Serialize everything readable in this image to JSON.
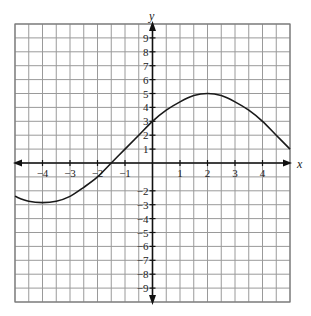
{
  "chart_data": {
    "type": "line",
    "title": "",
    "xlabel": "x",
    "ylabel": "y",
    "xlim": [
      -5,
      5
    ],
    "ylim": [
      -10,
      10
    ],
    "grid": true,
    "grid_x_step": 0.5,
    "grid_y_step": 1,
    "x_ticks": [
      -4,
      -3,
      -2,
      -1,
      1,
      2,
      3,
      4
    ],
    "y_ticks": [
      9,
      8,
      7,
      6,
      5,
      4,
      3,
      2,
      1,
      -2,
      -3,
      -4,
      -5,
      -6,
      -7,
      -8,
      -9
    ],
    "series": [
      {
        "name": "f(x)",
        "x": [
          -5,
          -4.5,
          -4,
          -3.5,
          -3,
          -2.5,
          -2,
          -1.5,
          -1,
          -0.5,
          0,
          0.5,
          1,
          1.5,
          2,
          2.5,
          3,
          3.5,
          4,
          4.5,
          5
        ],
        "y": [
          -2.4,
          -2.75,
          -2.85,
          -2.75,
          -2.4,
          -1.75,
          -1.0,
          0.0,
          1.0,
          2.0,
          3.0,
          3.8,
          4.4,
          4.85,
          5.0,
          4.85,
          4.4,
          3.8,
          3.0,
          2.0,
          1.0
        ]
      }
    ]
  }
}
